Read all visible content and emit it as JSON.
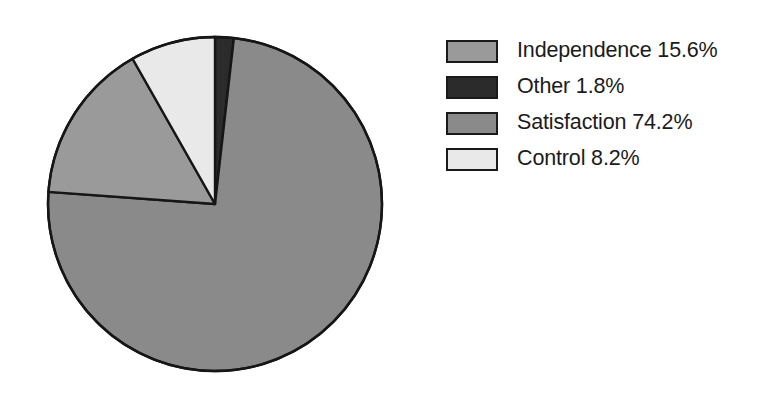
{
  "chart_data": {
    "type": "pie",
    "title": "",
    "subtitle": "",
    "xlabel": "",
    "ylabel": "",
    "units": "percent",
    "total": 99.8,
    "legend_position": "right",
    "grid": false,
    "start_angle_deg": 0,
    "direction": "clockwise",
    "categories": [
      "Independence",
      "Other",
      "Satisfaction",
      "Control"
    ],
    "values": [
      15.6,
      1.8,
      74.2,
      8.2
    ],
    "slices": [
      {
        "label": "Independence",
        "value": 15.6,
        "value_text": "15.6%",
        "legend_text": "Independence 15.6%",
        "color": "#9a9a9a",
        "start_deg": 273.6,
        "end_deg": 329.76
      },
      {
        "label": "Other",
        "value": 1.8,
        "value_text": "1.8%",
        "legend_text": "Other 1.8%",
        "color": "#2b2b2b",
        "start_deg": 0,
        "end_deg": 6.48
      },
      {
        "label": "Satisfaction",
        "value": 74.2,
        "value_text": "74.2%",
        "legend_text": "Satisfaction 74.2%",
        "color": "#8a8a8a",
        "start_deg": 6.48,
        "end_deg": 273.6
      },
      {
        "label": "Control",
        "value": 8.2,
        "value_text": "8.2%",
        "legend_text": "Control 8.2%",
        "color": "#e9e9e9",
        "start_deg": 329.76,
        "end_deg": 360
      }
    ]
  },
  "pie": {
    "center_x": 183,
    "center_y": 183,
    "radius": 167,
    "outline_color": "#161616",
    "outline_width": 2.4,
    "shadow_color": "#d8d8d8"
  },
  "legend": {
    "items": [
      {
        "label": "Independence 15.6%",
        "color": "#9a9a9a"
      },
      {
        "label": "Other 1.8%",
        "color": "#2b2b2b"
      },
      {
        "label": "Satisfaction 74.2%",
        "color": "#8a8a8a"
      },
      {
        "label": "Control 8.2%",
        "color": "#e9e9e9"
      }
    ]
  },
  "colors": {
    "background": "#ffffff",
    "text": "#1b1b1b",
    "outline": "#161616",
    "independence": "#9a9a9a",
    "other": "#2b2b2b",
    "satisfaction": "#8a8a8a",
    "control": "#e9e9e9"
  }
}
